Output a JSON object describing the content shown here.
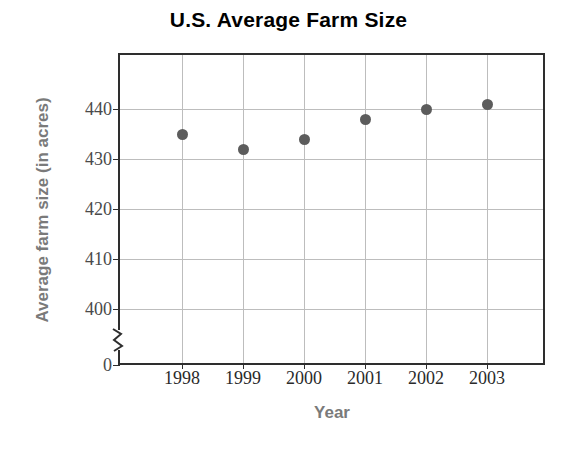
{
  "chart_data": {
    "type": "scatter",
    "title": "U.S. Average Farm Size",
    "xlabel": "Year",
    "ylabel": "Average farm size (in acres)",
    "categories": [
      "1998",
      "1999",
      "2000",
      "2001",
      "2002",
      "2003"
    ],
    "values": [
      435,
      432,
      434,
      438,
      440,
      441
    ],
    "series": [
      {
        "name": "Average farm size",
        "values": [
          435,
          432,
          434,
          438,
          440,
          441
        ]
      }
    ],
    "points": [
      {
        "x": "1998",
        "y": 435
      },
      {
        "x": "1999",
        "y": 432
      },
      {
        "x": "2000",
        "y": 434
      },
      {
        "x": "2001",
        "y": 438
      },
      {
        "x": "2002",
        "y": 440
      },
      {
        "x": "2003",
        "y": 441
      }
    ],
    "ytick_labels": [
      "440",
      "430",
      "420",
      "410",
      "400",
      "0"
    ],
    "ytick_values": [
      440,
      430,
      420,
      410,
      400,
      0
    ],
    "xtick_labels": [
      "1998",
      "1999",
      "2000",
      "2001",
      "2002",
      "2003"
    ],
    "ylim": [
      395,
      445
    ],
    "axis_break": true,
    "axis_break_between": [
      0,
      400
    ],
    "grid": true,
    "legend": false,
    "marker_color": "#5c5c5c",
    "grid_color": "#bdbdbd",
    "axis_color": "#2e2e2e",
    "title_color": "#000000",
    "axis_title_color": "#7a7a7a",
    "tick_label_color": "#3a3a3a",
    "background_color": "#ffffff"
  }
}
